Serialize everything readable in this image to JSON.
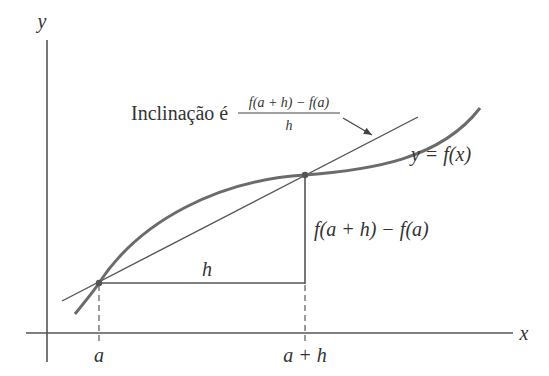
{
  "diagram": {
    "colors": {
      "background": "#ffffff",
      "axis": "#555555",
      "curve": "#6b6b6b",
      "secant": "#555555",
      "text": "#333333"
    },
    "axes": {
      "x_label": "x",
      "y_label": "y"
    },
    "curve": {
      "label": "y = f(x)"
    },
    "points": [
      {
        "name": "A",
        "x_label": "a",
        "description": "(a, f(a))"
      },
      {
        "name": "B",
        "x_label": "a + h",
        "description": "(a + h, f(a + h))"
      }
    ],
    "run": {
      "label": "h"
    },
    "rise": {
      "label": "f(a + h) − f(a)"
    },
    "slope_annotation": {
      "prefix": "Inclinação é",
      "numerator": "f(a + h) − f(a)",
      "denominator": "h"
    }
  }
}
